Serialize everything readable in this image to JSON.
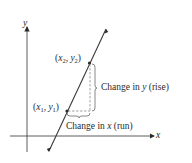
{
  "diagram": {
    "axes": {
      "x_label": "x",
      "y_label": "y"
    },
    "points": [
      {
        "id": "p1",
        "label_open": "(",
        "var_x": "x",
        "sub_x": "1",
        "sep": ", ",
        "var_y": "y",
        "sub_y": "1",
        "label_close": ")"
      },
      {
        "id": "p2",
        "label_open": "(",
        "var_x": "x",
        "sub_x": "2",
        "sep": ", ",
        "var_y": "y",
        "sub_y": "2",
        "label_close": ")"
      }
    ],
    "annotations": {
      "rise_prefix": "Change in ",
      "rise_var": "y",
      "rise_suffix": " (rise)",
      "run_prefix": "Change in ",
      "run_var": "x",
      "run_suffix": " (run)"
    },
    "colors": {
      "line": "#3a3a3a",
      "dashed": "#8a8a8a",
      "text": "#2a2a2a"
    }
  }
}
